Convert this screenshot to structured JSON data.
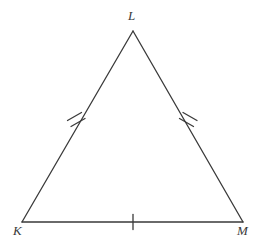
{
  "figure": {
    "name": "triangle-klm",
    "background_color": "#ffffff",
    "stroke_color": "#3a3a3a",
    "stroke_width": 1.3
  },
  "vertices": [
    {
      "id": "L",
      "label": "L",
      "x": 133,
      "y": 31,
      "label_x": 128,
      "label_y": 9
    },
    {
      "id": "K",
      "label": "K",
      "x": 22,
      "y": 222,
      "label_x": 13,
      "label_y": 224
    },
    {
      "id": "M",
      "label": "M",
      "x": 243,
      "y": 222,
      "label_x": 237,
      "label_y": 224
    }
  ],
  "sides": [
    {
      "id": "KL",
      "from": "K",
      "to": "L",
      "tick_count": 2,
      "tick_label": "double-tick"
    },
    {
      "id": "LM",
      "from": "L",
      "to": "M",
      "tick_count": 2,
      "tick_label": "double-tick"
    },
    {
      "id": "KM",
      "from": "K",
      "to": "M",
      "tick_count": 1,
      "tick_label": "single-tick"
    }
  ],
  "tick_marks": {
    "left_leg": {
      "count": 2,
      "center_x": 76,
      "center_y": 119,
      "length": 15,
      "spacing": 5,
      "angle_deg": 60
    },
    "right_leg": {
      "count": 2,
      "center_x": 189,
      "center_y": 119,
      "length": 15,
      "spacing": 5,
      "angle_deg": -60
    },
    "base": {
      "count": 1,
      "center_x": 133,
      "center_y": 222,
      "length": 15,
      "spacing": 0,
      "angle_deg": 90
    }
  }
}
